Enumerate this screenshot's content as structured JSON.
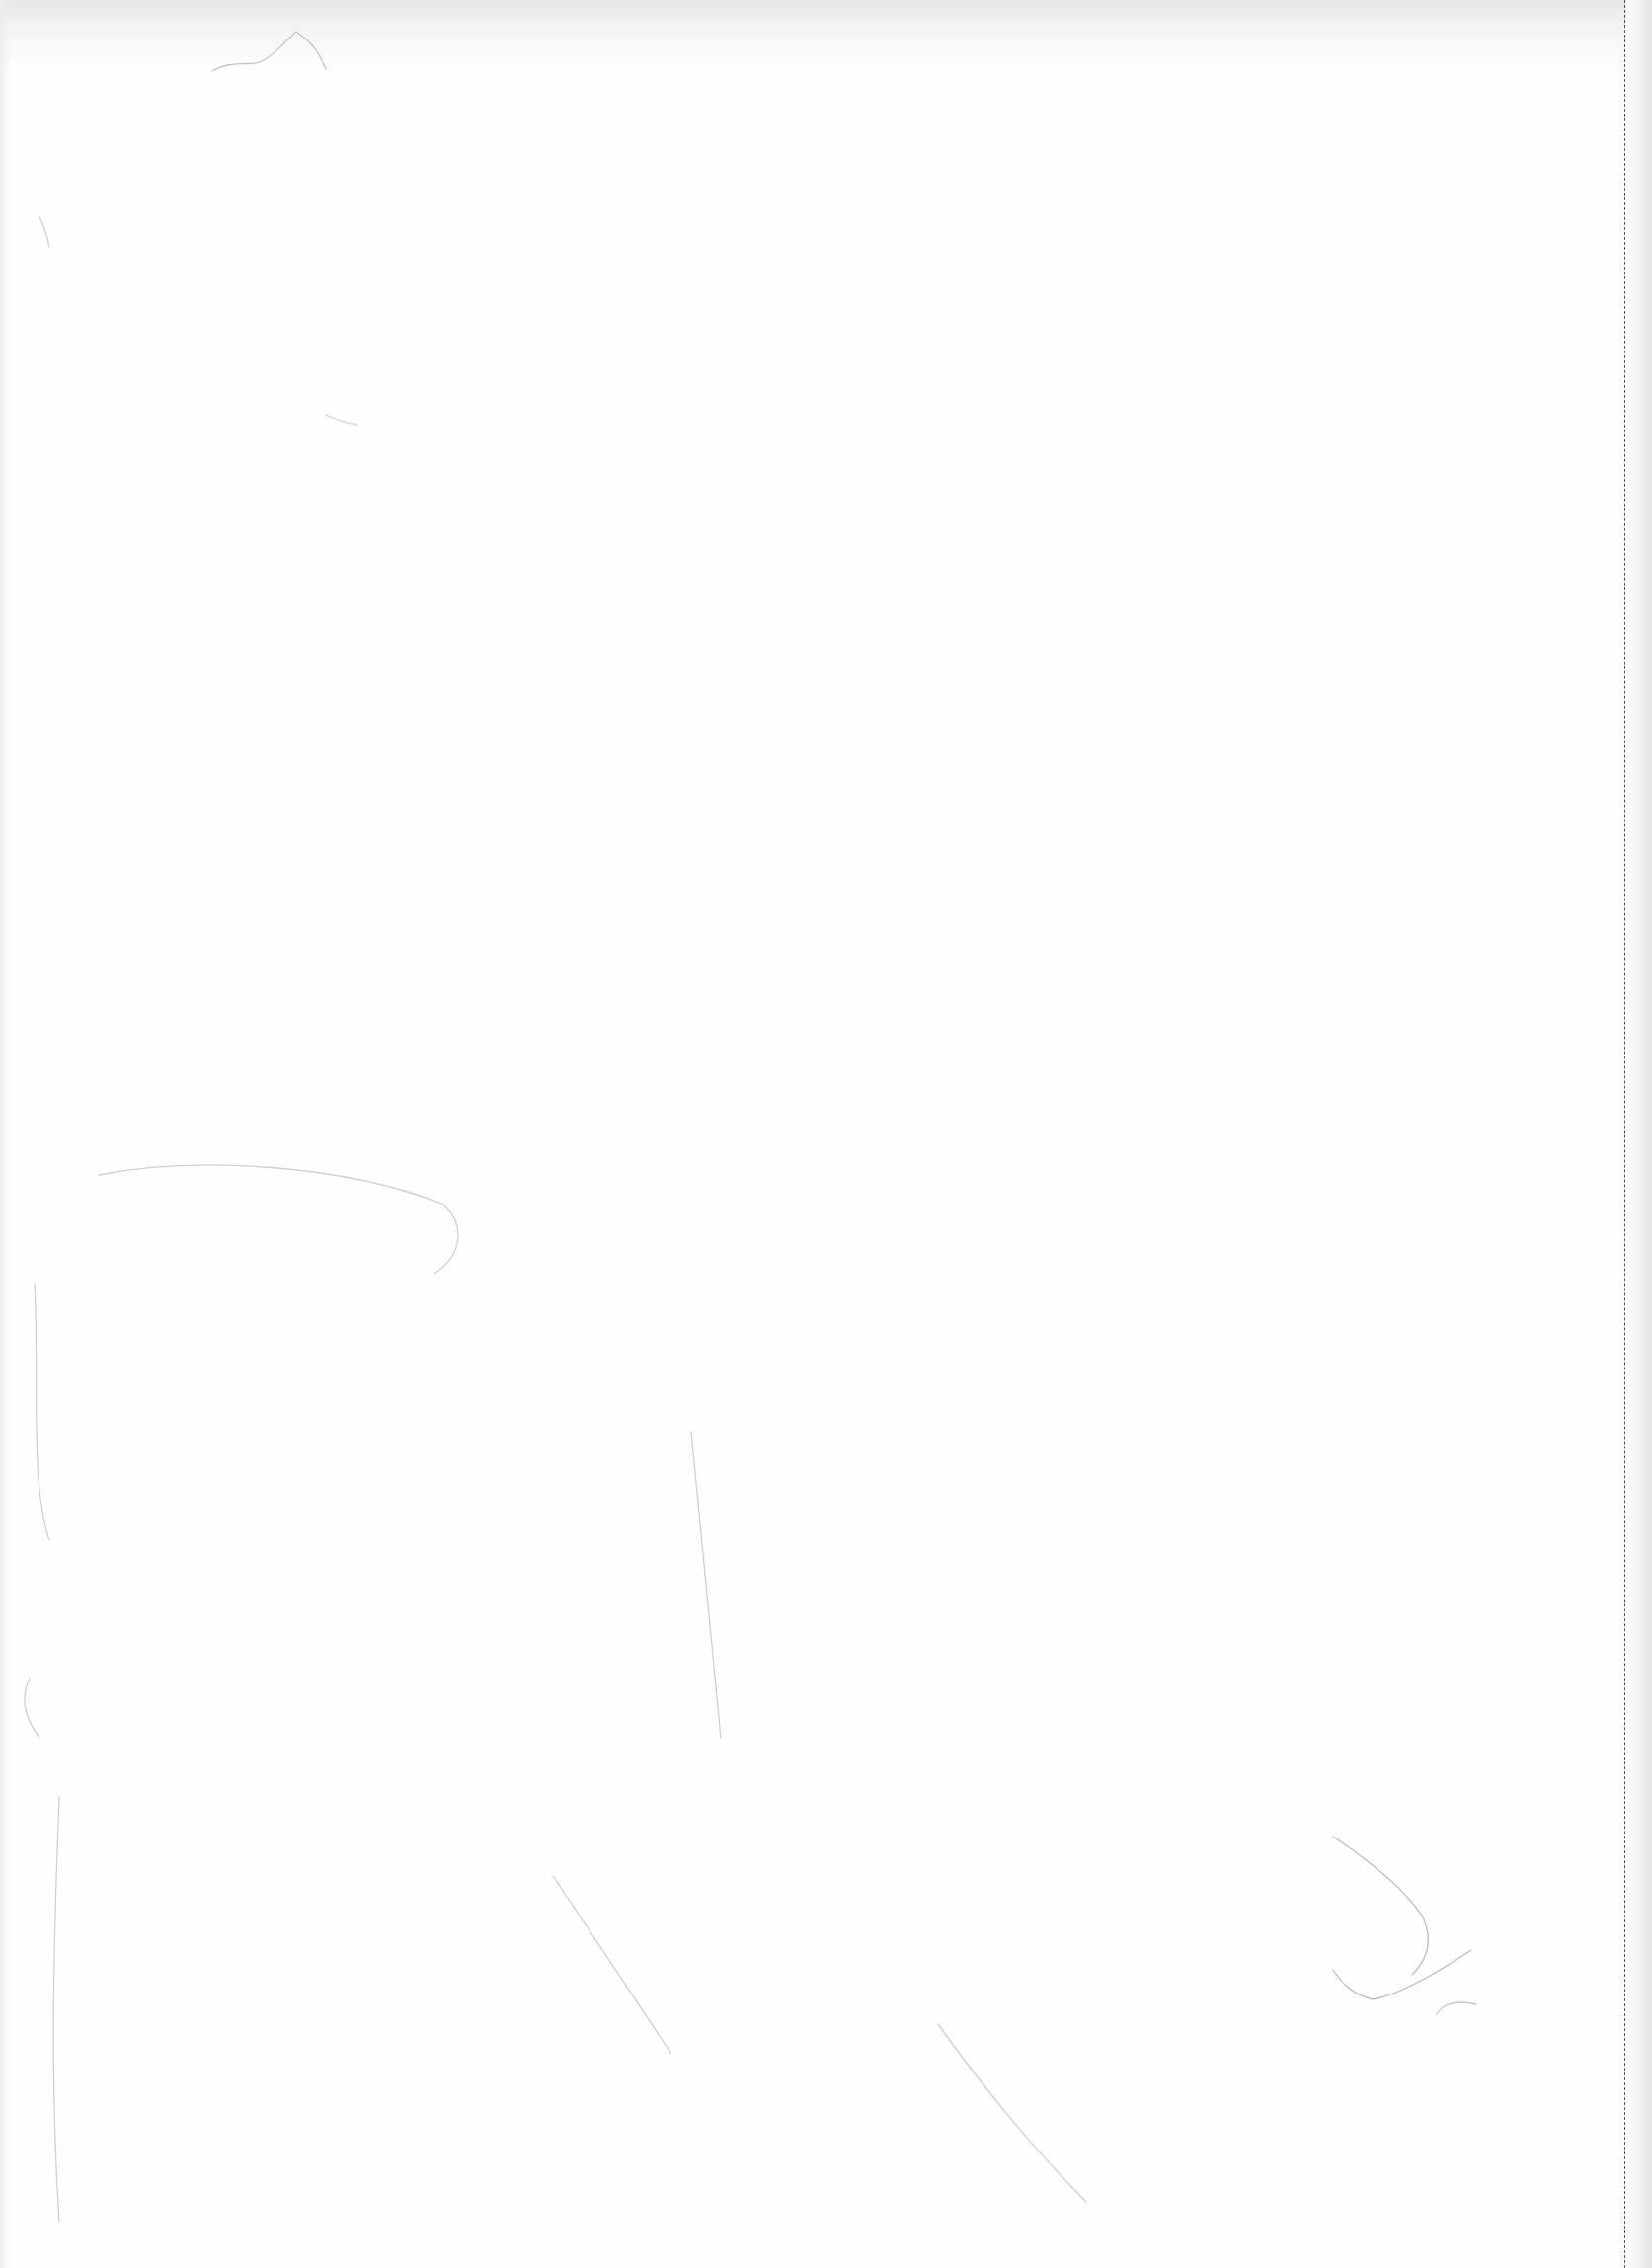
{
  "page": {
    "type": "blank-scanned-sheet",
    "background_color": "#fefefe",
    "perforation_color": "#555555",
    "faint_stroke_color": "#c8c8c8",
    "text": ""
  }
}
